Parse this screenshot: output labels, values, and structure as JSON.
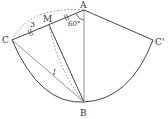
{
  "diagram": {
    "points": {
      "A": {
        "label": "A",
        "x": 84,
        "y": 10
      },
      "B": {
        "label": "B",
        "x": 84,
        "y": 102
      },
      "C": {
        "label": "C",
        "x": 12,
        "y": 40
      },
      "C_prime": {
        "label": "C'",
        "x": 153,
        "y": 40
      },
      "M": {
        "label": "M",
        "x": 49,
        "y": 25
      }
    },
    "labels": {
      "arc_length": "3",
      "angle": "60°",
      "segment_l": "l"
    },
    "colors": {
      "line": "#444444",
      "dotted": "#888888",
      "text": "#333333"
    }
  }
}
